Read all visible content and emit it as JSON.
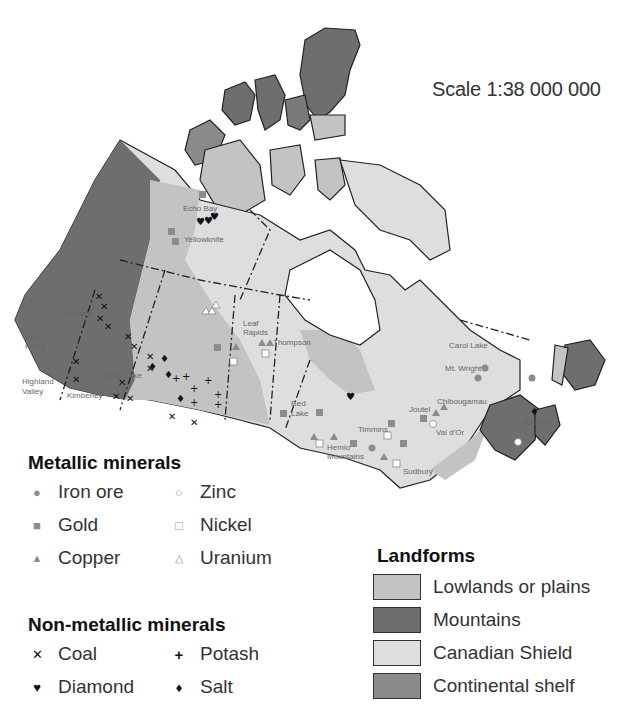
{
  "map": {
    "scale_label": "Scale 1:38 000 000",
    "place_labels": [
      {
        "name": "Echo Bay",
        "x": 183,
        "y": 211
      },
      {
        "name": "Yellowknife",
        "x": 184,
        "y": 242
      },
      {
        "name": "Houston",
        "x": 64,
        "y": 316
      },
      {
        "name": "Port",
        "x": 25,
        "y": 340
      },
      {
        "name": "Hardy",
        "x": 25,
        "y": 349
      },
      {
        "name": "Highland",
        "x": 22,
        "y": 384
      },
      {
        "name": "Valley",
        "x": 22,
        "y": 394
      },
      {
        "name": "Logan Lake",
        "x": 100,
        "y": 378
      },
      {
        "name": "Kimberley",
        "x": 67,
        "y": 398
      },
      {
        "name": "Leaf",
        "x": 243,
        "y": 326
      },
      {
        "name": "Rapids",
        "x": 243,
        "y": 335
      },
      {
        "name": "Thompson",
        "x": 273,
        "y": 345
      },
      {
        "name": "Red",
        "x": 291,
        "y": 406
      },
      {
        "name": "Lake",
        "x": 291,
        "y": 416
      },
      {
        "name": "Hemlo",
        "x": 327,
        "y": 450
      },
      {
        "name": "Mountains",
        "x": 327,
        "y": 459
      },
      {
        "name": "Timmins",
        "x": 358,
        "y": 432
      },
      {
        "name": "Joutel",
        "x": 409,
        "y": 412
      },
      {
        "name": "Chibougamau",
        "x": 437,
        "y": 404
      },
      {
        "name": "Val d'Or",
        "x": 436,
        "y": 435
      },
      {
        "name": "Sudbury",
        "x": 403,
        "y": 474
      },
      {
        "name": "Carol Lake",
        "x": 449,
        "y": 348
      },
      {
        "name": "Mt. Wright",
        "x": 445,
        "y": 371
      },
      {
        "name": "Bathurst",
        "x": 523,
        "y": 425
      }
    ]
  },
  "legend": {
    "metallic": {
      "title": "Metallic minerals",
      "items": [
        {
          "symbol": "●",
          "label": "Iron ore",
          "icon": "filled-circle-icon"
        },
        {
          "symbol": "○",
          "label": "Zinc",
          "icon": "hollow-circle-icon"
        },
        {
          "symbol": "■",
          "label": "Gold",
          "icon": "filled-square-icon"
        },
        {
          "symbol": "□",
          "label": "Nickel",
          "icon": "hollow-square-icon"
        },
        {
          "symbol": "▲",
          "label": "Copper",
          "icon": "filled-triangle-icon"
        },
        {
          "symbol": "△",
          "label": "Uranium",
          "icon": "hollow-triangle-icon"
        }
      ]
    },
    "non_metallic": {
      "title": "Non-metallic minerals",
      "items": [
        {
          "symbol": "✕",
          "label": "Coal",
          "icon": "x-cross-icon"
        },
        {
          "symbol": "+",
          "label": "Potash",
          "icon": "plus-icon"
        },
        {
          "symbol": "♥",
          "label": "Diamond",
          "icon": "diamond-gem-icon"
        },
        {
          "symbol": "♦",
          "label": "Salt",
          "icon": "diamond-icon"
        }
      ]
    },
    "landforms": {
      "title": "Landforms",
      "items": [
        {
          "label": "Lowlands or plains",
          "color": "#c3c3c3"
        },
        {
          "label": "Mountains",
          "color": "#6e6e6e"
        },
        {
          "label": "Canadian Shield",
          "color": "#dedede"
        },
        {
          "label": "Continental shelf",
          "color": "#8a8a8a"
        }
      ]
    }
  },
  "colors": {
    "lowlands": "#c3c3c3",
    "mountains": "#6e6e6e",
    "shield": "#dedede",
    "shelf": "#8a8a8a",
    "symbol_gray": "#8c8c8c"
  }
}
